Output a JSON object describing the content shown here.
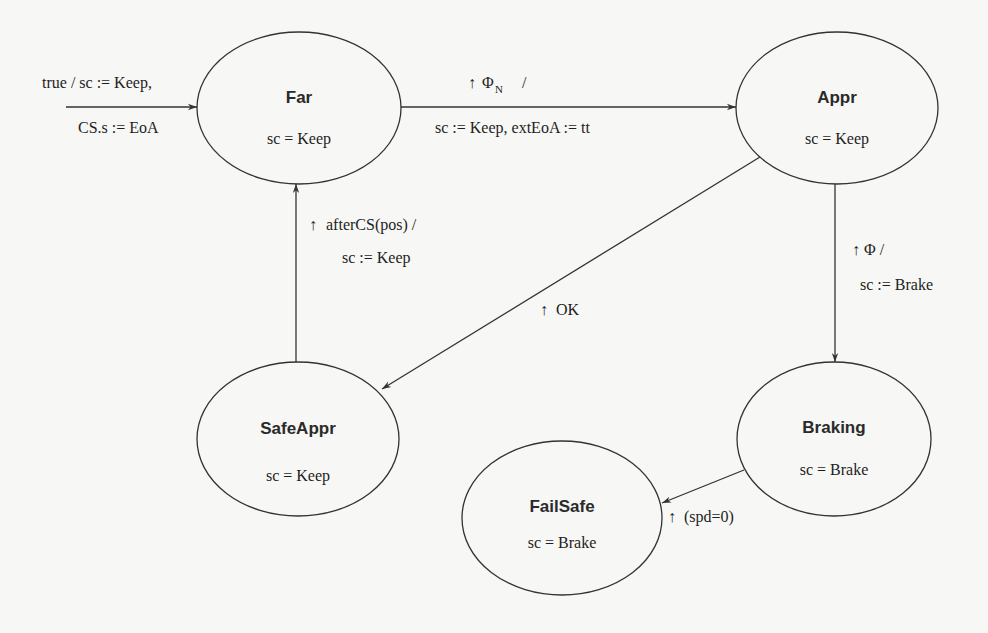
{
  "diagram": {
    "type": "state-machine",
    "colors": {
      "background": "#f7f7f5",
      "stroke": "#333333",
      "text": "#1e1e1e"
    },
    "states": [
      {
        "id": "far",
        "name": "Far",
        "invariant": "sc = Keep",
        "cx": 299,
        "cy": 108,
        "rx": 102,
        "ry": 76
      },
      {
        "id": "appr",
        "name": "Appr",
        "invariant": "sc = Keep",
        "cx": 837,
        "cy": 108,
        "rx": 101,
        "ry": 76
      },
      {
        "id": "safeappr",
        "name": "SafeAppr",
        "invariant": "sc = Keep",
        "cx": 298,
        "cy": 439,
        "rx": 101,
        "ry": 77
      },
      {
        "id": "braking",
        "name": "Braking",
        "invariant": "sc = Brake",
        "cx": 834,
        "cy": 439,
        "rx": 97,
        "ry": 77
      },
      {
        "id": "failsafe",
        "name": "FailSafe",
        "invariant": "sc = Brake",
        "cx": 562,
        "cy": 518,
        "rx": 100,
        "ry": 77
      }
    ],
    "transitions": [
      {
        "id": "init",
        "from": null,
        "to": "far",
        "label_line1": "true / sc := Keep,",
        "label_line2": "CS.s := EoA"
      },
      {
        "id": "far-appr",
        "from": "far",
        "to": "appr",
        "trigger_symbol": "↑",
        "label_line1": "Φ",
        "label_sub": "N",
        "label_slash": "/",
        "label_line2": "sc := Keep, extEoA := tt"
      },
      {
        "id": "appr-braking",
        "from": "appr",
        "to": "braking",
        "trigger_symbol": "↑",
        "label_line1": "Φ  /",
        "label_line2": "sc := Brake"
      },
      {
        "id": "appr-safeappr",
        "from": "appr",
        "to": "safeappr",
        "trigger_symbol": "↑",
        "label_line1": "OK"
      },
      {
        "id": "safeappr-far",
        "from": "safeappr",
        "to": "far",
        "trigger_symbol": "↑",
        "label_line1": "afterCS(pos) /",
        "label_line2": "sc := Keep"
      },
      {
        "id": "braking-failsafe",
        "from": "braking",
        "to": "failsafe",
        "trigger_symbol": "↑",
        "label_line1": "(spd=0)"
      }
    ]
  }
}
